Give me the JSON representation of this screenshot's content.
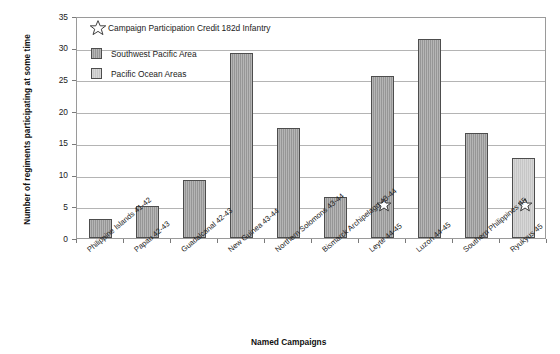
{
  "chart_data": {
    "type": "bar",
    "title": "",
    "xlabel": "Named Campaigns",
    "ylabel": "Number of regiments participating at some time",
    "ylim": [
      0,
      35
    ],
    "ytick_step": 5,
    "yticks": [
      "0",
      "5",
      "10",
      "15",
      "20",
      "25",
      "30",
      "35"
    ],
    "grid": true,
    "categories": [
      "Philippine Islands 41-42",
      "Papau 42-43",
      "Guadalcanal 42-43",
      "New Guinea 43-44",
      "Northern Solomons 43-44",
      "Bismarck Archipelago 43-44",
      "Leyte 44-45",
      "Luzon 44-45",
      "Southern Philippines 45",
      "Ryukyus 45"
    ],
    "values": [
      3.0,
      5.1,
      9.2,
      29.2,
      17.3,
      6.5,
      25.5,
      31.4,
      16.6,
      12.6
    ],
    "series_of_bar": [
      "Southwest Pacific Area",
      "Southwest Pacific Area",
      "Southwest Pacific Area",
      "Southwest Pacific Area",
      "Southwest Pacific Area",
      "Southwest Pacific Area",
      "Southwest Pacific Area",
      "Southwest Pacific Area",
      "Southwest Pacific Area",
      "Pacific Ocean Areas"
    ],
    "star_marked": [
      false,
      false,
      false,
      false,
      false,
      false,
      true,
      false,
      false,
      true
    ],
    "star_marker_value": 5,
    "legend": {
      "position": "upper-left-inside",
      "note": "Campaign Participation Credit 182d Infantry",
      "note_icon": "star-icon",
      "entries": [
        {
          "label": "Southwest Pacific Area",
          "color": "#969696",
          "swatch_icon": "legend-swatch-dark"
        },
        {
          "label": "Pacific Ocean Areas",
          "color": "#c6c6c6",
          "swatch_icon": "legend-swatch-light"
        }
      ]
    },
    "colors": {
      "southwest_pacific_area": "#969696",
      "pacific_ocean_areas": "#c6c6c6",
      "bar_border": "#4d4d4d",
      "gridline": "#b4b4b4",
      "plot_border": "#9a9a9a",
      "text": "#1a1a1a",
      "background": "#ffffff"
    }
  }
}
